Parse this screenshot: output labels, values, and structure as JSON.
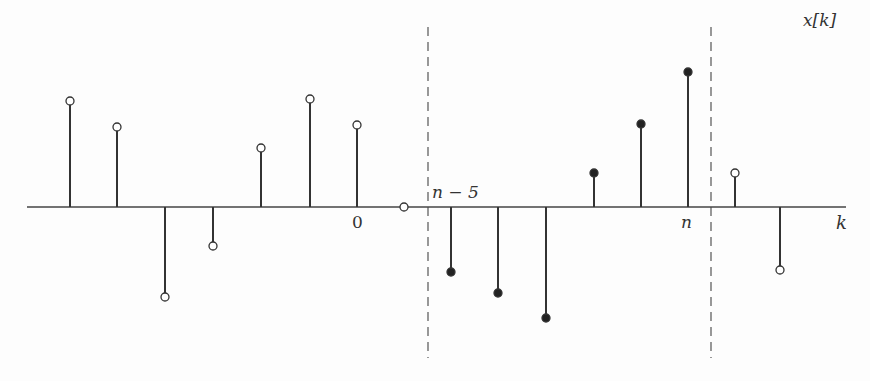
{
  "chart_data": {
    "type": "stem",
    "title": "",
    "ylabel": "x[k]",
    "xlabel": "k",
    "axis_y_px": 207,
    "tick_labels": [
      {
        "text": "0",
        "x": 357
      },
      {
        "text": "n",
        "x": 688
      },
      {
        "text": "n − 5",
        "x": 428
      }
    ],
    "window": {
      "start_label": "n − 5",
      "end_label": "n",
      "dashed_x_px": [
        428,
        711
      ]
    },
    "points": [
      {
        "k_offset": -6,
        "x": 70,
        "y": 101,
        "filled": false
      },
      {
        "k_offset": -5,
        "x": 117,
        "y": 127,
        "filled": false
      },
      {
        "k_offset": -4,
        "x": 165,
        "y": 297,
        "filled": false
      },
      {
        "k_offset": -3,
        "x": 213,
        "y": 246,
        "filled": false
      },
      {
        "k_offset": -2,
        "x": 261,
        "y": 148,
        "filled": false
      },
      {
        "k_offset": -1,
        "x": 310,
        "y": 99,
        "filled": false
      },
      {
        "k_offset": 0,
        "x": 357,
        "y": 125,
        "filled": false
      },
      {
        "k_offset": 1,
        "x": 404,
        "y": 207,
        "filled": false
      },
      {
        "k_offset": 2,
        "x": 451,
        "y": 272,
        "filled": true
      },
      {
        "k_offset": 3,
        "x": 498,
        "y": 293,
        "filled": true
      },
      {
        "k_offset": 4,
        "x": 546,
        "y": 318,
        "filled": true
      },
      {
        "k_offset": 5,
        "x": 594,
        "y": 173,
        "filled": true
      },
      {
        "k_offset": 6,
        "x": 641,
        "y": 124,
        "filled": true
      },
      {
        "k_offset": 7,
        "x": 688,
        "y": 72,
        "filled": true
      },
      {
        "k_offset": 8,
        "x": 735,
        "y": 173,
        "filled": false
      },
      {
        "k_offset": 9,
        "x": 780,
        "y": 270,
        "filled": false
      }
    ],
    "values_relative": [
      1.06,
      0.8,
      -0.9,
      -0.39,
      0.59,
      1.08,
      0.82,
      0,
      -0.65,
      -0.86,
      -1.11,
      0.34,
      0.83,
      1.35,
      0.34,
      -0.63
    ],
    "grid": false
  },
  "labels": {
    "ylabel": "x[k]",
    "xlabel": "k",
    "zero": "0",
    "n": "n",
    "n_minus_5": "n − 5"
  }
}
